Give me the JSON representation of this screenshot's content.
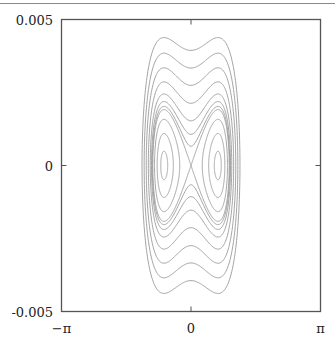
{
  "chart_data": {
    "type": "line",
    "title": "",
    "xlabel": "",
    "ylabel": "",
    "xlim": [
      -3.14159,
      3.14159
    ],
    "ylim": [
      -0.005,
      0.005
    ],
    "grid": false,
    "legend": null,
    "x_ticks": [
      {
        "value": -3.14159,
        "label": "−π"
      },
      {
        "value": 0,
        "label": "0"
      },
      {
        "value": 3.14159,
        "label": "π"
      }
    ],
    "y_ticks": [
      {
        "value": 0.005,
        "label": "0.005"
      },
      {
        "value": 0,
        "label": "0"
      },
      {
        "value": -0.005,
        "label": "-0.005"
      }
    ],
    "model": {
      "potential": "V(x) = k (x^2 - x0^2)^2",
      "k": 9.95e-06,
      "x0": 0.655,
      "saddle_energy": 1.83e-06
    },
    "series": [
      {
        "name": "orbit-outer-1",
        "energy": 9.6e-06
      },
      {
        "name": "orbit-outer-2",
        "energy": 7.4e-06
      },
      {
        "name": "orbit-outer-3",
        "energy": 5.6e-06
      },
      {
        "name": "orbit-outer-4",
        "energy": 4.1e-06
      },
      {
        "name": "orbit-outer-5",
        "energy": 3e-06
      },
      {
        "name": "orbit-outer-6",
        "energy": 2.4e-06
      },
      {
        "name": "orbit-outer-7",
        "energy": 2.05e-06
      },
      {
        "name": "separatrix",
        "energy": 1.83e-06
      },
      {
        "name": "orbit-inner-1",
        "energy": 1.25e-06
      },
      {
        "name": "orbit-inner-2",
        "energy": 6e-07
      },
      {
        "name": "orbit-inner-3",
        "energy": 1.2e-07
      }
    ],
    "line_color": "#9a9a9a",
    "axis_color": "#555555"
  }
}
